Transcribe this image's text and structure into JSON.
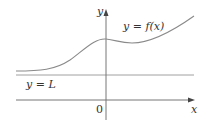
{
  "figure": {
    "axes": {
      "x_label": "x",
      "y_label": "y",
      "origin_label": "0"
    },
    "curve_label": "y = f(x)",
    "asymptote_label": "y = L",
    "colors": {
      "curve": "#8a8a8a",
      "asymptote": "#a0a0a0",
      "axis": "#555555",
      "text": "#333333"
    }
  }
}
